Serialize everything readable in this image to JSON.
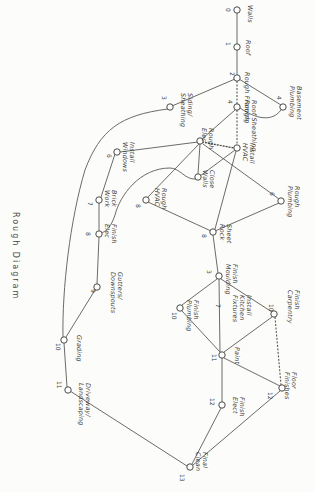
{
  "title": "Rough Diagram",
  "colors": {
    "ink": "#4a4a48",
    "paper": "#fcfcfa"
  },
  "nodes": [
    {
      "id": "n0",
      "num": "0",
      "label": "Walls",
      "x": 237,
      "y": 10
    },
    {
      "id": "n1",
      "num": "1",
      "label": "Roof",
      "x": 237,
      "y": 47
    },
    {
      "id": "n2",
      "num": "2",
      "label": "Rough Framing",
      "x": 237,
      "y": 78
    },
    {
      "id": "n3",
      "num": "3",
      "label": "Siding/\nSheathing",
      "x": 170,
      "y": 107
    },
    {
      "id": "n4",
      "num": "4",
      "label": "Basement\nPlumbing",
      "x": 283,
      "y": 107
    },
    {
      "id": "n4b",
      "num": "4",
      "label": "Roof Sheathing\nRough",
      "x": 237,
      "y": 107
    },
    {
      "id": "n5",
      "num": "5",
      "label": "Rough\nElec",
      "x": 200,
      "y": 141
    },
    {
      "id": "n6",
      "num": "",
      "label": "Install\nHVAC",
      "x": 237,
      "y": 148
    },
    {
      "id": "n7",
      "num": "6",
      "label": "Install\nWindows",
      "x": 117,
      "y": 152
    },
    {
      "id": "n8",
      "num": "7",
      "label": "Close\nWalls",
      "x": 198,
      "y": 177
    },
    {
      "id": "n9",
      "num": "8",
      "label": "Rough\nHVAC",
      "x": 146,
      "y": 200
    },
    {
      "id": "n10",
      "num": "6",
      "label": "Rough\nPlumbing",
      "x": 281,
      "y": 201
    },
    {
      "id": "n11",
      "num": "8",
      "label": "Sheet\nRock",
      "x": 213,
      "y": 232
    },
    {
      "id": "n12",
      "num": "7",
      "label": "Brick\nWork",
      "x": 99,
      "y": 200
    },
    {
      "id": "n13",
      "num": "8",
      "label": "Finish\nElec",
      "x": 99,
      "y": 234
    },
    {
      "id": "n14",
      "num": "3",
      "label": "Finish\nMoulding",
      "x": 219,
      "y": 276
    },
    {
      "id": "n15",
      "num": "7",
      "label": "Install\nKitchen\nFixtures",
      "x": 219,
      "y": 308
    },
    {
      "id": "n16",
      "num": "10",
      "label": "Finish\nPlumbing",
      "x": 180,
      "y": 308
    },
    {
      "id": "n17",
      "num": "10",
      "label": "Finish\nCarpentry",
      "x": 274,
      "y": 314
    },
    {
      "id": "n18",
      "num": "9",
      "label": "Gutters/\nDownspouts",
      "x": 97,
      "y": 287
    },
    {
      "id": "n19",
      "num": "10",
      "label": "Grading",
      "x": 64,
      "y": 340
    },
    {
      "id": "n20",
      "num": "11",
      "label": "Paint",
      "x": 222,
      "y": 355
    },
    {
      "id": "n21",
      "num": "12",
      "label": "Floor\nFinishes",
      "x": 282,
      "y": 388
    },
    {
      "id": "n22",
      "num": "12",
      "label": "Finish\nElect",
      "x": 222,
      "y": 405
    },
    {
      "id": "n23",
      "num": "11",
      "label": "Driveway/\nLandscaping",
      "x": 68,
      "y": 390
    },
    {
      "id": "n24",
      "num": "13",
      "label": "Final\nClean",
      "x": 190,
      "y": 467
    }
  ],
  "edges": [
    [
      "n0",
      "n1"
    ],
    [
      "n1",
      "n2"
    ],
    [
      "n2",
      "n3"
    ],
    [
      "n2",
      "n4"
    ],
    [
      "n2",
      "n4b"
    ],
    [
      "n4",
      "n4b"
    ],
    [
      "n4b",
      "n5"
    ],
    [
      "n4b",
      "n6"
    ],
    [
      "n3",
      "n23"
    ],
    [
      "n5",
      "n6"
    ],
    [
      "n5",
      "n7"
    ],
    [
      "n5",
      "n8"
    ],
    [
      "n6",
      "n8"
    ],
    [
      "n5",
      "n9"
    ],
    [
      "n6",
      "n10"
    ],
    [
      "n9",
      "n11"
    ],
    [
      "n10",
      "n11"
    ],
    [
      "n6",
      "n11"
    ],
    [
      "n7",
      "n12"
    ],
    [
      "n12",
      "n13"
    ],
    [
      "n13",
      "n18"
    ],
    [
      "n18",
      "n19"
    ],
    [
      "n19",
      "n23"
    ],
    [
      "n11",
      "n14"
    ],
    [
      "n14",
      "n16"
    ],
    [
      "n14",
      "n17"
    ],
    [
      "n16",
      "n20"
    ],
    [
      "n15",
      "n20"
    ],
    [
      "n17",
      "n20"
    ],
    [
      "n17",
      "n21"
    ],
    [
      "n20",
      "n22"
    ],
    [
      "n20",
      "n21"
    ],
    [
      "n22",
      "n24"
    ],
    [
      "n21",
      "n24"
    ],
    [
      "n23",
      "n24"
    ],
    [
      "n11",
      "n14"
    ]
  ]
}
